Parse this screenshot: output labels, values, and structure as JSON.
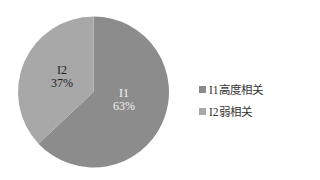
{
  "chart_data": {
    "type": "pie",
    "title": "",
    "categories": [
      "I1高度相关",
      "I2弱相关"
    ],
    "values": [
      63,
      37
    ],
    "unit": "%",
    "slice_labels": [
      {
        "name": "I1",
        "value": "63%"
      },
      {
        "name": "I2",
        "value": "37%"
      }
    ],
    "colors": [
      "#8c8c8c",
      "#a8a8a8"
    ],
    "label_colors": [
      "#ffffff",
      "#222222"
    ],
    "start_angle": "12 o'clock, clockwise",
    "legend_position": "right"
  },
  "legend": {
    "items": [
      {
        "label": "I1高度相关",
        "color": "#8c8c8c"
      },
      {
        "label": "I2弱相关",
        "color": "#a8a8a8"
      }
    ]
  }
}
